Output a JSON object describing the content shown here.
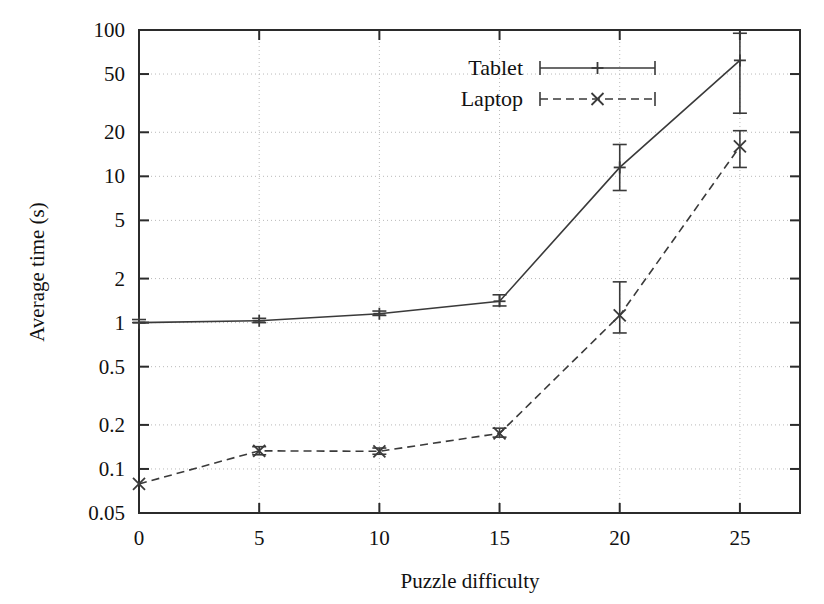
{
  "chart_data": {
    "type": "line",
    "title": "",
    "xlabel": "Puzzle difficulty",
    "ylabel": "Average time (s)",
    "yscale": "log",
    "xlim": [
      0,
      27.5
    ],
    "ylim": [
      0.05,
      100
    ],
    "grid": true,
    "legend_position": "top-center",
    "x": [
      0,
      5,
      10,
      15,
      20,
      25
    ],
    "xticks": [
      "0",
      "5",
      "10",
      "15",
      "20",
      "25"
    ],
    "yticks": [
      "100",
      "50",
      "20",
      "10",
      "5",
      "2",
      "1",
      "0.5",
      "0.2",
      "0.1",
      "0.05"
    ],
    "ytick_values": [
      100,
      50,
      20,
      10,
      5,
      2,
      1,
      0.5,
      0.2,
      0.1,
      0.05
    ],
    "series": [
      {
        "name": "Tablet",
        "style": "solid",
        "marker": "plus",
        "values": [
          1.0,
          1.03,
          1.15,
          1.4,
          11.5,
          62.0
        ],
        "err_low": [
          1.0,
          1.0,
          1.12,
          1.3,
          8.0,
          27.0
        ],
        "err_high": [
          1.05,
          1.07,
          1.2,
          1.55,
          16.5,
          95.0
        ]
      },
      {
        "name": "Laptop",
        "style": "dashed",
        "marker": "cross",
        "values": [
          0.079,
          0.133,
          0.132,
          0.175,
          1.12,
          16.0
        ],
        "err_low": [
          0.079,
          0.125,
          0.126,
          0.165,
          0.85,
          11.5
        ],
        "err_high": [
          0.079,
          0.142,
          0.139,
          0.19,
          1.9,
          20.5
        ]
      }
    ],
    "legend": [
      {
        "label": "Tablet",
        "style": "solid",
        "marker": "plus"
      },
      {
        "label": "Laptop",
        "style": "dashed",
        "marker": "cross"
      }
    ],
    "colors": {
      "line": "#3a3a3a",
      "axis": "#2b2b2b",
      "grid": "#b9b9b9",
      "background": "#ffffff"
    }
  }
}
